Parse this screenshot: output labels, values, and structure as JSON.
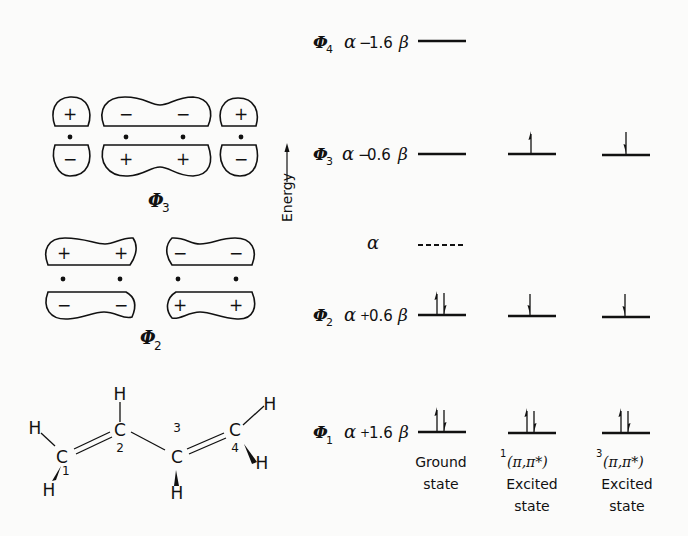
{
  "figure": {
    "type": "molecular_orbital_energy_diagram",
    "molecule": "1,3-butadiene",
    "energy_axis_label": "Energy",
    "orbitals": [
      {
        "name": "Φ",
        "index": "4",
        "energy": "α − 1.6β",
        "alpha": "α",
        "sign": "−",
        "coef": "1.6",
        "beta": "β",
        "occupancy": {
          "ground": "",
          "singlet": "",
          "triplet": ""
        }
      },
      {
        "name": "Φ",
        "index": "3",
        "energy": "α − 0.6β",
        "alpha": "α",
        "sign": "−",
        "coef": "0.6",
        "beta": "β",
        "occupancy": {
          "ground": "",
          "singlet": "up",
          "triplet": "down"
        }
      },
      {
        "name": "Φ",
        "index": "2",
        "energy": "α + 0.6β",
        "alpha": "α",
        "sign": "+",
        "coef": "0.6",
        "beta": "β",
        "occupancy": {
          "ground": "pair",
          "singlet": "down",
          "triplet": "down"
        }
      },
      {
        "name": "Φ",
        "index": "1",
        "energy": "α + 1.6β",
        "alpha": "α",
        "sign": "+",
        "coef": "1.6",
        "beta": "β",
        "occupancy": {
          "ground": "pair",
          "singlet": "pair",
          "triplet": "pair"
        }
      }
    ],
    "reference_level": {
      "label": "α",
      "style": "dashed"
    },
    "states": [
      {
        "key": "ground",
        "line1": "Ground",
        "line2": "state",
        "line3": ""
      },
      {
        "key": "singlet",
        "superscript": "1",
        "line1": "(π,π*)",
        "line2": "Excited",
        "line3": "state"
      },
      {
        "key": "triplet",
        "superscript": "3",
        "line1": "(π,π*)",
        "line2": "Excited",
        "line3": "state"
      }
    ],
    "orbital_pictures": [
      {
        "label_symbol": "Φ",
        "label_index": "3",
        "top_signs": [
          "+",
          "−",
          "−",
          "+"
        ],
        "bottom_signs": [
          "−",
          "+",
          "+",
          "−"
        ]
      },
      {
        "label_symbol": "Φ",
        "label_index": "2",
        "top_signs": [
          "+",
          "+",
          "−",
          "−"
        ],
        "bottom_signs": [
          "−",
          "−",
          "+",
          "+"
        ]
      }
    ],
    "structure": {
      "atoms": [
        {
          "symbol": "C",
          "number": "1"
        },
        {
          "symbol": "C",
          "number": "2"
        },
        {
          "symbol": "C",
          "number": "3"
        },
        {
          "symbol": "C",
          "number": "4"
        }
      ],
      "hydrogen": "H"
    }
  }
}
